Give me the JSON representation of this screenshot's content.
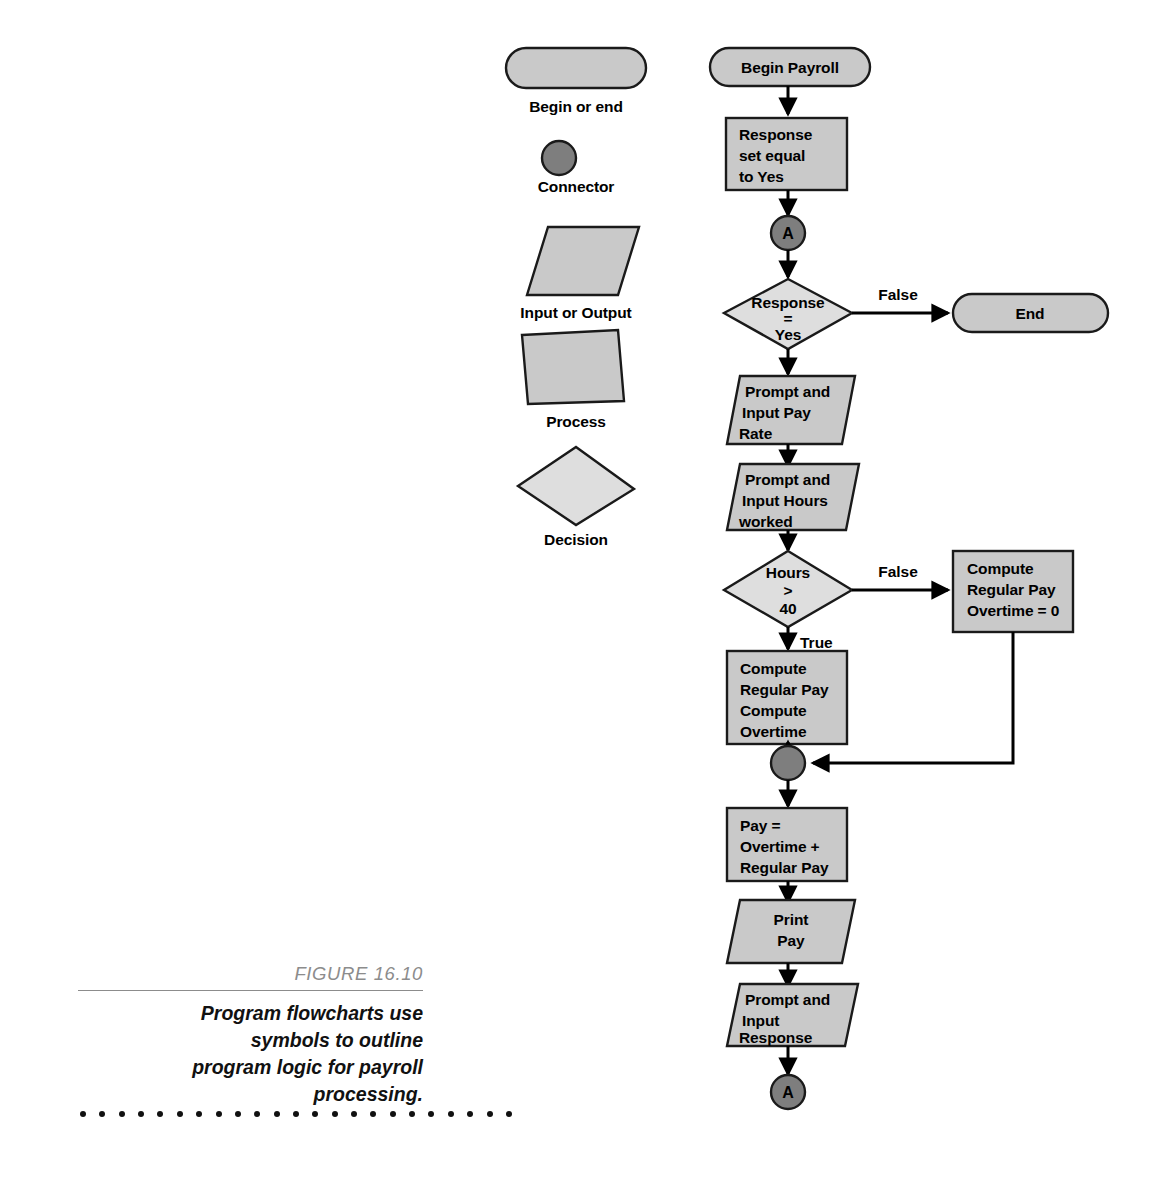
{
  "figure": {
    "number": "FIGURE 16.10",
    "caption_lines": [
      "Program flowcharts use",
      "symbols to outline",
      "program logic for payroll",
      "processing."
    ],
    "dot_count": 23
  },
  "colors": {
    "fill_light": "#c9c9c9",
    "fill_decision": "#dedede",
    "fill_connector": "#7e7e7e",
    "stroke": "#1a1a1a",
    "line": "#000000",
    "figure_number": "#8c8c8c"
  },
  "legend": {
    "title": "Flowchart symbol key",
    "items": [
      {
        "shape": "terminal",
        "label": "Begin or end"
      },
      {
        "shape": "connector",
        "label": "Connector"
      },
      {
        "shape": "parallelogram",
        "label": "Input or Output"
      },
      {
        "shape": "rectangle",
        "label": "Process"
      },
      {
        "shape": "diamond",
        "label": "Decision"
      }
    ]
  },
  "chart_data": {
    "type": "flowchart",
    "title": "Program flowcharts use symbols to outline program logic for payroll processing.",
    "nodes": [
      {
        "id": "begin",
        "shape": "terminal",
        "lines": [
          "Begin Payroll"
        ],
        "align": "center"
      },
      {
        "id": "set-response",
        "shape": "rectangle",
        "lines": [
          "Response",
          "set equal",
          "to Yes"
        ],
        "align": "left"
      },
      {
        "id": "conn-a-top",
        "shape": "connector",
        "lines": [
          "A"
        ],
        "align": "center"
      },
      {
        "id": "dec-response",
        "shape": "diamond",
        "lines": [
          "Response",
          "=",
          "Yes"
        ],
        "align": "center"
      },
      {
        "id": "end",
        "shape": "terminal",
        "lines": [
          "End"
        ],
        "align": "center"
      },
      {
        "id": "input-rate",
        "shape": "parallelogram",
        "lines": [
          "Prompt and",
          "Input Pay",
          "Rate"
        ],
        "align": "left"
      },
      {
        "id": "input-hours",
        "shape": "parallelogram",
        "lines": [
          "Prompt and",
          "Input Hours",
          "worked"
        ],
        "align": "left"
      },
      {
        "id": "dec-hours",
        "shape": "diamond",
        "lines": [
          "Hours",
          ">",
          "40"
        ],
        "align": "center"
      },
      {
        "id": "compute-reg",
        "shape": "rectangle",
        "lines": [
          "Compute",
          "Regular Pay",
          "Overtime = 0"
        ],
        "align": "left"
      },
      {
        "id": "compute-ot",
        "shape": "rectangle",
        "lines": [
          "Compute",
          "Regular Pay",
          "Compute",
          "Overtime"
        ],
        "align": "left"
      },
      {
        "id": "conn-merge",
        "shape": "connector",
        "lines": [],
        "align": "center"
      },
      {
        "id": "pay-total",
        "shape": "rectangle",
        "lines": [
          "Pay =",
          "Overtime +",
          "Regular Pay"
        ],
        "align": "left"
      },
      {
        "id": "print-pay",
        "shape": "parallelogram",
        "lines": [
          "Print",
          "Pay"
        ],
        "align": "center"
      },
      {
        "id": "input-resp",
        "shape": "parallelogram",
        "lines": [
          "Prompt and",
          "Input",
          "Response"
        ],
        "align": "left"
      },
      {
        "id": "conn-a-bottom",
        "shape": "connector",
        "lines": [
          "A"
        ],
        "align": "center"
      }
    ],
    "edges": [
      {
        "from": "begin",
        "to": "set-response",
        "label": ""
      },
      {
        "from": "set-response",
        "to": "conn-a-top",
        "label": ""
      },
      {
        "from": "conn-a-top",
        "to": "dec-response",
        "label": ""
      },
      {
        "from": "dec-response",
        "to": "end",
        "label": "False"
      },
      {
        "from": "dec-response",
        "to": "input-rate",
        "label": ""
      },
      {
        "from": "input-rate",
        "to": "input-hours",
        "label": ""
      },
      {
        "from": "input-hours",
        "to": "dec-hours",
        "label": ""
      },
      {
        "from": "dec-hours",
        "to": "compute-reg",
        "label": "False"
      },
      {
        "from": "dec-hours",
        "to": "compute-ot",
        "label": "True"
      },
      {
        "from": "compute-ot",
        "to": "conn-merge",
        "label": ""
      },
      {
        "from": "compute-reg",
        "to": "conn-merge",
        "label": ""
      },
      {
        "from": "conn-merge",
        "to": "pay-total",
        "label": ""
      },
      {
        "from": "pay-total",
        "to": "print-pay",
        "label": ""
      },
      {
        "from": "print-pay",
        "to": "input-resp",
        "label": ""
      },
      {
        "from": "input-resp",
        "to": "conn-a-bottom",
        "label": ""
      }
    ],
    "branch_labels": [
      "False",
      "True"
    ]
  },
  "flow_text": {
    "begin": "Begin Payroll",
    "set_response_1": "Response",
    "set_response_2": "set equal",
    "set_response_3": "to Yes",
    "conn_a_top": "A",
    "dec_response_1": "Response",
    "dec_response_2": "=",
    "dec_response_3": "Yes",
    "false_1": "False",
    "end": "End",
    "input_rate_1": "Prompt and",
    "input_rate_2": "Input Pay",
    "input_rate_3": "Rate",
    "input_hours_1": "Prompt and",
    "input_hours_2": "Input Hours",
    "input_hours_3": "worked",
    "dec_hours_1": "Hours",
    "dec_hours_2": ">",
    "dec_hours_3": "40",
    "false_2": "False",
    "true_1": "True",
    "compute_reg_1": "Compute",
    "compute_reg_2": "Regular Pay",
    "compute_reg_3": "Overtime = 0",
    "compute_ot_1": "Compute",
    "compute_ot_2": "Regular Pay",
    "compute_ot_3": "Compute",
    "compute_ot_4": "Overtime",
    "pay_total_1": "Pay =",
    "pay_total_2": "Overtime +",
    "pay_total_3": "Regular Pay",
    "print_pay_1": "Print",
    "print_pay_2": "Pay",
    "input_resp_1": "Prompt and",
    "input_resp_2": "Input",
    "input_resp_3": "Response",
    "conn_a_bottom": "A"
  },
  "legend_text": {
    "terminal": "Begin or end",
    "connector": "Connector",
    "parallelogram": "Input or Output",
    "rectangle": "Process",
    "diamond": "Decision"
  }
}
